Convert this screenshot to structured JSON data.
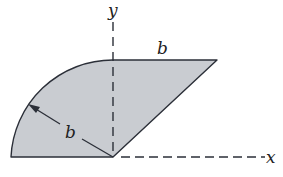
{
  "figure": {
    "labels": {
      "y_axis": "y",
      "x_axis": "x",
      "top_length": "b",
      "radius": "b"
    },
    "colors": {
      "fill": "#c9ccd1",
      "stroke": "#2b2f38",
      "background": "#ffffff"
    }
  }
}
